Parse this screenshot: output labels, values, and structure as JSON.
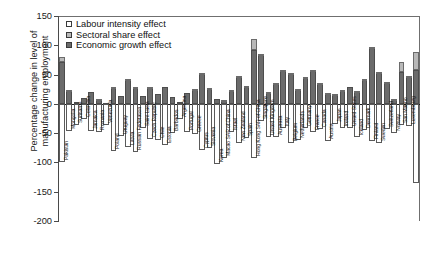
{
  "chart_data": {
    "type": "bar",
    "stacked": true,
    "title": "",
    "xlabel": "",
    "ylabel": "Percentage change in level of\nmanufacturing employment",
    "ylim": [
      -200,
      150
    ],
    "yticks": [
      150,
      100,
      50,
      0,
      -50,
      -100,
      -150,
      -200
    ],
    "ytick_labels": [
      "150",
      "100",
      "50",
      "0",
      "-50",
      "-100",
      "-150",
      "-200"
    ],
    "grid": false,
    "legend_position": "top-left",
    "legend": [
      {
        "label": "Labour intensity effect",
        "color": "#ffffff",
        "key": "labour"
      },
      {
        "label": "Sectoral share effect",
        "color": "#b9b9b9",
        "key": "sector"
      },
      {
        "label": "Economic growth effect",
        "color": "#6b6b6b",
        "key": "growth"
      }
    ],
    "series": [
      {
        "name": "Economic growth effect",
        "key": "growth",
        "color": "#6b6b6b"
      },
      {
        "name": "Sectoral share effect",
        "key": "sector",
        "color": "#b9b9b9"
      },
      {
        "name": "Labour intensity effect",
        "key": "labour",
        "color": "#ffffff"
      }
    ],
    "categories": [
      "Pakistan",
      "Mongolia",
      "Suriname",
      "Colombia",
      "Jamaica",
      "Romania",
      "Venezuela",
      "Poland",
      "Uruguay",
      "Latvia",
      "Russian Federation",
      "Saint Lucia",
      "Czech Republic",
      "Chile",
      "Estonia",
      "Barbados",
      "Argentina",
      "Portugal",
      "Greece",
      "Cyprus",
      "Slovenia",
      "Korea",
      "Macao SAR of China",
      "Israel",
      "New Zealand",
      "Spain",
      "Hong Kong SAR of China",
      "Singapore",
      "United Kingdom",
      "Australia",
      "Italy",
      "Belgium",
      "Netherlands",
      "Germany",
      "France",
      "Canada",
      "Austria",
      "Japan",
      "Ireland",
      "United States",
      "Iceland",
      "Denmark",
      "Finland",
      "Sweden",
      "Switzerland",
      "Norway",
      "San Marino",
      "Luxembourg"
    ],
    "bars": [
      {
        "category": "Pakistan",
        "growth": 72,
        "sector": 8,
        "labour": -100
      },
      {
        "category": "Mongolia",
        "growth": 22,
        "sector": 1,
        "labour": -46
      },
      {
        "category": "Suriname",
        "growth": 4,
        "sector": 0,
        "labour": -36
      },
      {
        "category": "Colombia",
        "growth": 10,
        "sector": -18,
        "labour": -26
      },
      {
        "category": "Jamaica",
        "growth": 21,
        "sector": 0,
        "labour": -46
      },
      {
        "category": "Romania",
        "growth": 7,
        "sector": 1,
        "labour": -48
      },
      {
        "category": "Venezuela",
        "growth": 2,
        "sector": -9,
        "labour": -36
      },
      {
        "category": "Poland",
        "growth": 28,
        "sector": 1,
        "labour": -80
      },
      {
        "category": "Uruguay",
        "growth": 14,
        "sector": -12,
        "labour": -55
      },
      {
        "category": "Latvia",
        "growth": 42,
        "sector": 1,
        "labour": -74
      },
      {
        "category": "Russian Federation",
        "growth": 27,
        "sector": 1,
        "labour": -83
      },
      {
        "category": "Saint Lucia",
        "growth": 13,
        "sector": -17,
        "labour": -42
      },
      {
        "category": "Czech Republic",
        "growth": 27,
        "sector": 1,
        "labour": -60
      },
      {
        "category": "Chile",
        "growth": 16,
        "sector": -4,
        "labour": -62
      },
      {
        "category": "Estonia",
        "growth": 28,
        "sector": 0,
        "labour": -70
      },
      {
        "category": "Barbados",
        "growth": 11,
        "sector": -2,
        "labour": -50
      },
      {
        "category": "Argentina",
        "growth": 4,
        "sector": -3,
        "labour": -26
      },
      {
        "category": "Portugal",
        "growth": 18,
        "sector": -4,
        "labour": -48
      },
      {
        "category": "Greece",
        "growth": 25,
        "sector": 1,
        "labour": -52
      },
      {
        "category": "Cyprus",
        "growth": 52,
        "sector": 1,
        "labour": -78
      },
      {
        "category": "Slovenia",
        "growth": 26,
        "sector": 1,
        "labour": -76
      },
      {
        "category": "Korea",
        "growth": 8,
        "sector": -1,
        "labour": -103
      },
      {
        "category": "Macao SAR of China",
        "growth": 5,
        "sector": 1,
        "labour": -93
      },
      {
        "category": "Israel",
        "growth": 23,
        "sector": 1,
        "labour": -48
      },
      {
        "category": "New Zealand",
        "growth": 47,
        "sector": 1,
        "labour": -67
      },
      {
        "category": "Spain",
        "growth": 29,
        "sector": 1,
        "labour": -58
      },
      {
        "category": "Hong Kong SAR of China",
        "growth": 92,
        "sector": 18,
        "labour": -93
      },
      {
        "category": "Singapore",
        "growth": 84,
        "sector": 1,
        "labour": -30
      },
      {
        "category": "United Kingdom",
        "growth": 19,
        "sector": 1,
        "labour": -57
      },
      {
        "category": "Australia",
        "growth": 34,
        "sector": 1,
        "labour": -57
      },
      {
        "category": "Italy",
        "growth": 56,
        "sector": 1,
        "labour": -42
      },
      {
        "category": "Belgium",
        "growth": 51,
        "sector": 1,
        "labour": -66
      },
      {
        "category": "Netherlands",
        "growth": 25,
        "sector": 1,
        "labour": -62
      },
      {
        "category": "Germany",
        "growth": 45,
        "sector": 1,
        "labour": -42
      },
      {
        "category": "France",
        "growth": 57,
        "sector": 1,
        "labour": -48
      },
      {
        "category": "Canada",
        "growth": 35,
        "sector": 1,
        "labour": -43
      },
      {
        "category": "Austria",
        "growth": 18,
        "sector": 1,
        "labour": -63
      },
      {
        "category": "Japan",
        "growth": 16,
        "sector": 1,
        "labour": -35
      },
      {
        "category": "Ireland",
        "growth": 22,
        "sector": 1,
        "labour": -41
      },
      {
        "category": "United States",
        "growth": 28,
        "sector": -4,
        "labour": -42
      },
      {
        "category": "Iceland",
        "growth": 21,
        "sector": 1,
        "labour": -56
      },
      {
        "category": "Denmark",
        "growth": 42,
        "sector": 1,
        "labour": -44
      },
      {
        "category": "Finland",
        "growth": 96,
        "sector": 1,
        "labour": -63
      },
      {
        "category": "Sweden",
        "growth": 53,
        "sector": 1,
        "labour": -67
      },
      {
        "category": "Switzerland",
        "growth": 37,
        "sector": 1,
        "labour": -43
      },
      {
        "category": "Norway",
        "growth": 8,
        "sector": 1,
        "labour": -49
      },
      {
        "category": "San Marino",
        "growth": 55,
        "sector": 17,
        "labour": -36
      },
      {
        "category": "Luxembourg",
        "growth": 47,
        "sector": 1,
        "labour": -37
      },
      {
        "category": "Luxembourg2",
        "growth": 58,
        "sector": 30,
        "labour": -135
      }
    ]
  }
}
